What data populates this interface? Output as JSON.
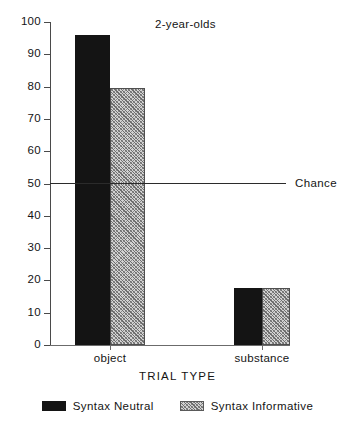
{
  "chart_data": {
    "type": "bar",
    "title": "2-year-olds",
    "xlabel": "TRIAL TYPE",
    "ylabel": "",
    "categories": [
      "object",
      "substance"
    ],
    "series": [
      {
        "name": "Syntax Neutral",
        "values": [
          96,
          17.5
        ],
        "fill": "solid",
        "color": "#141414"
      },
      {
        "name": "Syntax Informative",
        "values": [
          79.5,
          17.5
        ],
        "fill": "hatched",
        "color": "#d2d2d2"
      }
    ],
    "ylim": [
      0,
      100
    ],
    "yticks": [
      0,
      10,
      20,
      30,
      40,
      50,
      60,
      70,
      80,
      90,
      100
    ],
    "ytick_labels": [
      "0",
      "10",
      "20",
      "30",
      "40",
      "50",
      "60",
      "70",
      "80",
      "90",
      "100"
    ],
    "grid": false,
    "legend_position": "bottom",
    "annotations": [
      {
        "name": "chance-line",
        "label": "Chance",
        "y": 50,
        "type": "hline"
      }
    ]
  },
  "legend": {
    "items": [
      {
        "label": "Syntax Neutral",
        "fill": "solid"
      },
      {
        "label": "Syntax Informative",
        "fill": "hatched"
      }
    ]
  }
}
